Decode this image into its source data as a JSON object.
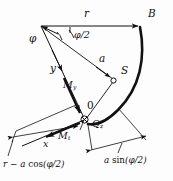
{
  "figure": {
    "background_color": "#fdfdfd",
    "ink_color": "#111111"
  },
  "labels": {
    "angle_phi": "φ",
    "angle_phi_half": "φ/2",
    "radius_r": "r",
    "point_b": "B",
    "distance_a": "a",
    "centroid_s": "S",
    "axis_y": "y",
    "axis_x": "x",
    "origin": "0",
    "moment_my_base": "M",
    "moment_my_sub": "y",
    "moment_mt_base": "M",
    "moment_mt_sub": "t",
    "force_qz_base": "Q",
    "force_qz_sub": "z"
  },
  "dimensions": {
    "left": {
      "prefix": "r − a ",
      "function": "cos",
      "argument": "(φ/2)"
    },
    "right": {
      "prefix": "a ",
      "function": "sin",
      "argument": "(φ/2)"
    }
  },
  "markers": {
    "centroid_point": "open-circle",
    "origin_point": "crossed-circle"
  }
}
